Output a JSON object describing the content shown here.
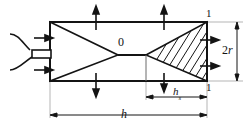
{
  "figure": {
    "type": "engineering-cross-section-diagram",
    "line_color": "#141414",
    "hatch_color": "#141414",
    "background_color": "#ffffff",
    "thin_line_color": "#555555"
  },
  "labels": {
    "origin_point": "0",
    "radius_dimension": "2r",
    "radius_dimension_base": "2",
    "radius_dimension_symbol": "r",
    "total_length": "h",
    "partial_length_base": "h",
    "partial_length_subscript": "s",
    "section_mark_top": "1",
    "section_mark_bottom": "1"
  },
  "geometry": {
    "chamber_left": 50,
    "chamber_right": 207,
    "chamber_top": 22,
    "chamber_bottom": 81,
    "centerline_y": 55,
    "apex_x": 146,
    "left_triangle_apex_x": 118,
    "inlet_duct_left": 32,
    "inlet_duct_right": 50,
    "inlet_duct_top": 50,
    "inlet_duct_bottom": 58,
    "hatch_line_count": 8
  },
  "arrows": {
    "top_edge_up": 2,
    "bottom_edge_down": 3,
    "left_inlet_right": 2,
    "right_edge_right": 2,
    "vertical_dimension": "2r",
    "horizontal_dimension_full": "h",
    "horizontal_dimension_partial": "hs"
  }
}
